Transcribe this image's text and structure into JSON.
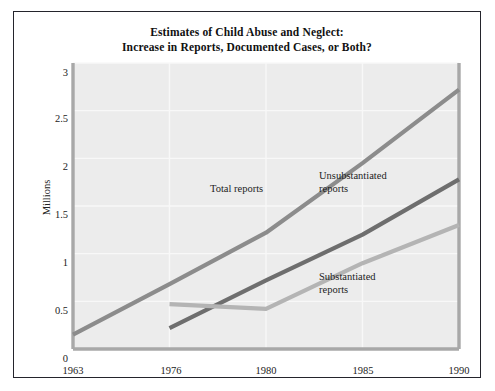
{
  "figure": {
    "title_line1": "Estimates of Child Abuse and Neglect:",
    "title_line2": "Increase in Reports, Documented Cases, or Both?",
    "border_color": "#24242c",
    "plot_background": "#ececec",
    "gridline_color": "#f8f8f8",
    "axis_color": "#a8a8a8"
  },
  "chart_data": {
    "type": "line",
    "title": "Estimates of Child Abuse and Neglect: Increase in Reports, Documented Cases, or Both?",
    "xlabel": "",
    "ylabel": "Millions",
    "categories": [
      "1963",
      "1976",
      "1980",
      "1985",
      "1990"
    ],
    "xticklabels": [
      "1963",
      "1976",
      "1980",
      "1985",
      "1990"
    ],
    "yticklabels": [
      "0",
      "0.5",
      "1",
      "1.5",
      "2",
      "2.5",
      "3"
    ],
    "ytickvalues": [
      0,
      0.5,
      1,
      1.5,
      2,
      2.5,
      3
    ],
    "ylim": [
      0,
      3
    ],
    "grid": true,
    "legend_position": "inline-annotations",
    "series": [
      {
        "name": "Total reports",
        "color": "#8c8c8c",
        "x": [
          "1963",
          "1976",
          "1980",
          "1985",
          "1990"
        ],
        "values": [
          0.15,
          0.68,
          1.22,
          1.95,
          2.72
        ]
      },
      {
        "name": "Unsubstantiated reports",
        "color": "#6e6e6e",
        "x": [
          "1976",
          "1980",
          "1985",
          "1990"
        ],
        "values": [
          0.22,
          0.72,
          1.2,
          1.78
        ]
      },
      {
        "name": "Substantiated reports",
        "color": "#b4b4b4",
        "x": [
          "1976",
          "1980",
          "1985",
          "1990"
        ],
        "values": [
          0.47,
          0.42,
          0.9,
          1.3
        ]
      }
    ],
    "annotations": [
      {
        "text": "Total reports",
        "series": "Total reports"
      },
      {
        "text": "Unsubstantiated reports",
        "series": "Unsubstantiated reports"
      },
      {
        "text": "Substantiated reports",
        "series": "Substantiated reports"
      }
    ]
  },
  "labels": {
    "total_reports": "Total reports",
    "unsubstantiated_line1": "Unsubstantiated",
    "unsubstantiated_line2": "reports",
    "substantiated_line1": "Substantiated",
    "substantiated_line2": "reports"
  },
  "yticks": [
    {
      "label": "3",
      "top": 55
    },
    {
      "label": "2.5",
      "top": 101
    },
    {
      "label": "2",
      "top": 149
    },
    {
      "label": "1.5",
      "top": 197
    },
    {
      "label": "1",
      "top": 245
    },
    {
      "label": "0.5",
      "top": 293
    },
    {
      "label": "0",
      "top": 341
    }
  ],
  "xticks": [
    {
      "label": "1963",
      "left": 29
    },
    {
      "label": "1976",
      "left": 127
    },
    {
      "label": "1980",
      "left": 222
    },
    {
      "label": "1985",
      "left": 319
    },
    {
      "label": "1990",
      "left": 415
    }
  ]
}
